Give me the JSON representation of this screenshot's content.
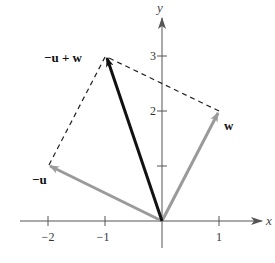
{
  "figure": {
    "type": "vector-addition-diagram",
    "axes": {
      "x_label": "x",
      "y_label": "y",
      "x_ticks": [
        {
          "value": -2,
          "label": "−2"
        },
        {
          "value": -1,
          "label": "−1"
        },
        {
          "value": 1,
          "label": "1"
        }
      ],
      "y_ticks": [
        {
          "value": 1,
          "label": ""
        },
        {
          "value": 2,
          "label": "2"
        },
        {
          "value": 3,
          "label": "3"
        }
      ]
    },
    "vectors": [
      {
        "name": "neg-u",
        "label": "−u",
        "from": [
          0,
          0
        ],
        "to": [
          -2,
          1
        ],
        "color": "#9a9a9a"
      },
      {
        "name": "w",
        "label": "w",
        "from": [
          0,
          0
        ],
        "to": [
          1,
          2
        ],
        "color": "#9a9a9a"
      },
      {
        "name": "neg-u-plus-w",
        "label": "−u + w",
        "from": [
          0,
          0
        ],
        "to": [
          -1,
          3
        ],
        "color": "#111111"
      }
    ],
    "dashed_lines": [
      {
        "from": [
          -2,
          1
        ],
        "to": [
          -1,
          3
        ]
      },
      {
        "from": [
          1,
          2
        ],
        "to": [
          -1,
          3
        ]
      }
    ],
    "colors": {
      "axis": "#555555",
      "resultant": "#111111",
      "component": "#9a9a9a",
      "dashed": "#222222"
    }
  }
}
